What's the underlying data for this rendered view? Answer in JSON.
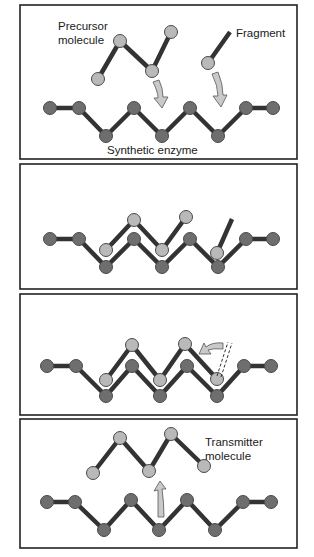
{
  "colors": {
    "panel_border": "#222222",
    "bond": "#333333",
    "enzyme_node": "#6e6e6e",
    "molecule_node": "#b9b9b9",
    "node_stroke": "#4a4a4a",
    "arrow_fill": "#c9c9c9",
    "arrow_stroke": "#555555",
    "background": "#ffffff"
  },
  "panels": [
    {
      "id": "step-1",
      "labels": {
        "precursor_line1": "Precursor",
        "precursor_line2": "molecule",
        "fragment": "Fragment",
        "enzyme": "Synthetic enzyme"
      }
    },
    {
      "id": "step-2"
    },
    {
      "id": "step-3"
    },
    {
      "id": "step-4",
      "labels": {
        "transmitter_line1": "Transmitter",
        "transmitter_line2": "molecule"
      }
    }
  ]
}
